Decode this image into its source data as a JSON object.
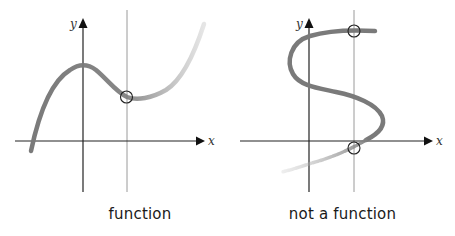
{
  "panels": [
    {
      "id": "left",
      "caption": "function",
      "x_axis_label": "x",
      "y_axis_label": "y",
      "curve_type": "cubic",
      "vertical_line_test": {
        "intersections": 1
      }
    },
    {
      "id": "right",
      "caption": "not a function",
      "x_axis_label": "x",
      "y_axis_label": "y",
      "curve_type": "s-shaped",
      "vertical_line_test": {
        "intersections": 2
      }
    }
  ],
  "colors": {
    "curve": "#7a7a7a",
    "axis": "#222222",
    "test_line": "#9a9a9a",
    "circle": "#222222",
    "text": "#1a1a1a"
  }
}
